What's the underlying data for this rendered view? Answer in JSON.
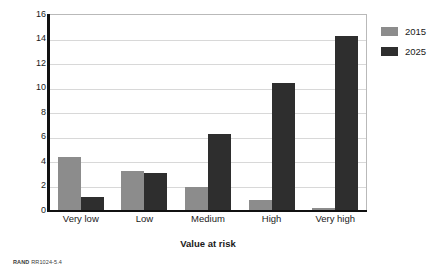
{
  "chart_data": {
    "type": "bar",
    "title": "",
    "xlabel": "Value at risk",
    "ylabel": "Average number of tools used",
    "categories": [
      "Very low",
      "Low",
      "Medium",
      "High",
      "Very high"
    ],
    "series": [
      {
        "name": "2015",
        "color": "#8c8c8c",
        "values": [
          4.3,
          3.15,
          1.85,
          0.85,
          0.15
        ]
      },
      {
        "name": "2025",
        "color": "#2e2e2e",
        "values": [
          1.05,
          3.05,
          6.2,
          10.4,
          14.2
        ]
      }
    ],
    "ylim": [
      0,
      16
    ],
    "ytick_labels": [
      "0",
      "2",
      "4",
      "6",
      "8",
      "10",
      "12",
      "14",
      "16"
    ],
    "ytick_values": [
      0,
      2,
      4,
      6,
      8,
      10,
      12,
      14,
      16
    ],
    "grid": true,
    "legend_position": "right"
  },
  "credit": {
    "brand": "RAND",
    "figure_number": "RR1024-5.4"
  }
}
